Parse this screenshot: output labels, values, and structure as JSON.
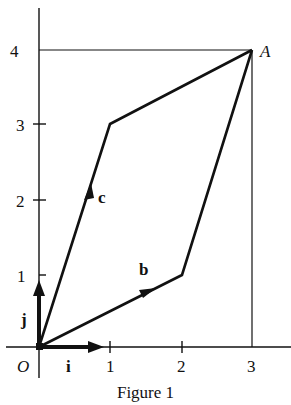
{
  "figure": {
    "caption": "Figure 1",
    "origin_label": "O",
    "point_label": "A",
    "x_ticks": [
      "1",
      "2",
      "3"
    ],
    "y_ticks": [
      "1",
      "2",
      "3",
      "4"
    ],
    "vectors": {
      "i": "i",
      "j": "j",
      "b": "b",
      "c": "c"
    },
    "points": {
      "O": [
        0,
        0
      ],
      "A": [
        3,
        4
      ],
      "b_end": [
        2,
        1
      ],
      "c_end": [
        1,
        3
      ]
    },
    "colors": {
      "ink": "#111111",
      "background": "#ffffff"
    }
  }
}
